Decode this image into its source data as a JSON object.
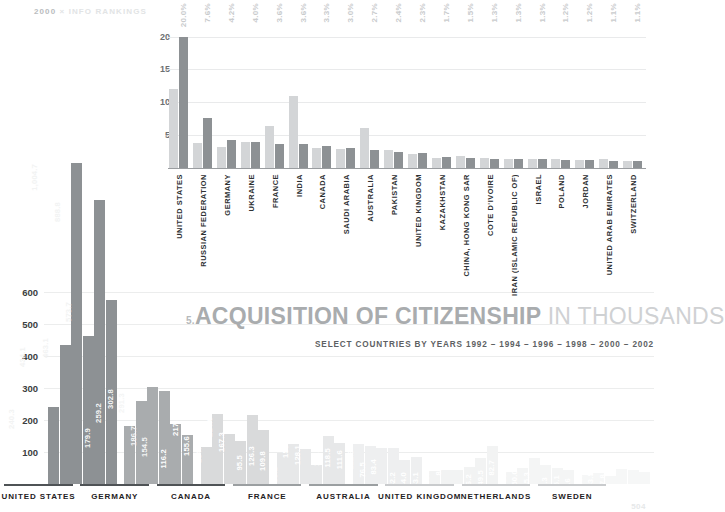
{
  "masthead": {
    "number": "2000",
    "sep": "×",
    "label": "INFO RANKINGS"
  },
  "page_number": "504",
  "title": {
    "index": "5.",
    "main": "ACQUISITION OF CITIZENSHIP",
    "tail": "IN THOUSANDS",
    "subtitle": "SELECT COUNTRIES BY YEARS 1992 – 1994 – 1996 – 1998 – 2000 – 2002"
  },
  "chart_data": [
    {
      "id": "top-chart",
      "type": "bar",
      "title": "",
      "ylabel": "",
      "xlabel": "",
      "ylim": [
        0,
        21
      ],
      "yticks": [
        "5",
        "10",
        "15",
        "20"
      ],
      "ytick_values": [
        5,
        10,
        15,
        20
      ],
      "grid": true,
      "legend": "",
      "categories": [
        "UNITED STATES",
        "RUSSIAN FEDERATION",
        "GERMANY",
        "UKRAINE",
        "FRANCE",
        "INDIA",
        "CANADA",
        "SAUDI ARABIA",
        "AUSTRALIA",
        "PAKISTAN",
        "UNITED KINGDOM",
        "KAZAKHSTAN",
        "CHINA, HONG KONG SAR",
        "COTE D'IVOIRE",
        "IRAN (ISLAMIC REPUBLIC OF)",
        "ISRAEL",
        "POLAND",
        "JORDAN",
        "UNITED ARAB EMIRATES",
        "SWITZERLAND"
      ],
      "percent_labels": [
        "20.0%",
        "7.6%",
        "4.2%",
        "4.0%",
        "3.6%",
        "3.6%",
        "3.3%",
        "3.0%",
        "2.7%",
        "2.4%",
        "2.3%",
        "1.7%",
        "1.5%",
        "1.3%",
        "1.3%",
        "1.3%",
        "1.2%",
        "1.2%",
        "1.1%",
        "1.1%"
      ],
      "series": [
        {
          "name": "light",
          "color": "#d3d5d7",
          "values": [
            12.0,
            3.8,
            3.2,
            4.0,
            6.4,
            11.0,
            3.1,
            2.9,
            6.1,
            2.7,
            2.2,
            1.6,
            1.9,
            1.5,
            1.4,
            1.4,
            1.3,
            1.2,
            1.4,
            1.0
          ]
        },
        {
          "name": "dark",
          "color": "#8d9194",
          "values": [
            20.0,
            7.6,
            4.2,
            4.0,
            3.6,
            3.6,
            3.3,
            3.0,
            2.7,
            2.4,
            2.3,
            1.7,
            1.5,
            1.3,
            1.3,
            1.3,
            1.2,
            1.2,
            1.1,
            1.1
          ]
        }
      ]
    },
    {
      "id": "main-chart",
      "type": "bar",
      "title": "ACQUISITION OF CITIZENSHIP IN THOUSANDS",
      "subtitle": "SELECT COUNTRIES BY YEARS 1992 – 1994 – 1996 – 1998 – 2000 – 2002",
      "ylabel": "",
      "xlabel": "",
      "ylim": [
        0,
        1050
      ],
      "yticks": [
        "100",
        "200",
        "300",
        "400",
        "500",
        "600"
      ],
      "ytick_values": [
        100,
        200,
        300,
        400,
        500,
        600
      ],
      "grid": true,
      "years": [
        "1992",
        "1994",
        "1996",
        "1998",
        "2000",
        "2002"
      ],
      "categories": [
        "UNITED STATES",
        "GERMANY",
        "CANADA",
        "FRANCE",
        "AUSTRALIA",
        "UNITED KINGDOM",
        "NETHERLANDS",
        "SWEDEN"
      ],
      "groups": [
        {
          "name": "UNITED STATES",
          "color": "#8d9194",
          "label_color": "#f2f3f3",
          "opacity": 1.0,
          "values": [
            240.3,
            434.1,
            1004.7,
            463.1,
            888.8,
            573.7
          ],
          "value_labels": [
            "240.3",
            "434.1",
            "1,004.7",
            "463.1",
            "888.8",
            "573.7"
          ]
        },
        {
          "name": "GERMANY",
          "color": "#a9acae",
          "label_color": "#f4f5f5",
          "opacity": 1.0,
          "values": [
            179.9,
            259.2,
            302.8,
            291.3,
            186.7,
            154.5
          ],
          "value_labels": [
            "179.9",
            "259.2",
            "302.8",
            "291.3",
            "186.7",
            "154.5"
          ]
        },
        {
          "name": "CANADA",
          "color": "#d9dadb",
          "label_color": "#ffffff",
          "opacity": 1.0,
          "values": [
            116.2,
            217.3,
            155.6,
            134.6,
            214.6,
            167.3
          ],
          "value_labels": [
            "116.2",
            "217.3",
            "155.6",
            "134.6",
            "214.6",
            "167.3"
          ]
        },
        {
          "name": "FRANCE",
          "color": "#e7e8e9",
          "label_color": "#ffffff",
          "opacity": 1.0,
          "values": [
            95.5,
            126.3,
            109.8,
            58.1,
            150.0,
            128.1
          ],
          "value_labels": [
            "95.5",
            "126.3",
            "109.8",
            "58.1",
            "150.0",
            "128.1"
          ]
        },
        {
          "name": "AUSTRALIA",
          "color": "#eeeff0",
          "label_color": "#ffffff",
          "opacity": 1.0,
          "values": [
            125.4,
            118.5,
            111.6,
            112.3,
            76.5,
            83.4
          ],
          "value_labels": [
            "125.4",
            "118.5",
            "111.6",
            "112.3",
            "76.5",
            "83.4"
          ]
        },
        {
          "name": "UNITED KINGDOM",
          "color": "#f2f3f3",
          "label_color": "#ffffff",
          "opacity": 1.0,
          "values": [
            42.2,
            44.0,
            43.1,
            53.9,
            82.2,
            120.1
          ],
          "value_labels": [
            "42.2",
            "44.0",
            "43.1",
            "53.9",
            "82.2",
            "120.1"
          ]
        },
        {
          "name": "NETHERLANDS",
          "color": "#f4f5f5",
          "label_color": "#ffffff",
          "opacity": 1.0,
          "values": [
            36.2,
            49.5,
            82.7,
            59.2,
            50.0,
            45.3
          ],
          "value_labels": [
            "36.2",
            "49.5",
            "82.7",
            "59.2",
            "50.0",
            "45.3"
          ]
        },
        {
          "name": "SWEDEN",
          "color": "#f6f7f7",
          "label_color": "#ffffff",
          "opacity": 1.0,
          "values": [
            29.3,
            35.1,
            25.6,
            46.5,
            43.5,
            37.8
          ],
          "value_labels": [
            "29.3",
            "35.1",
            "25.6",
            "46.5",
            "43.5",
            "37.8"
          ]
        }
      ]
    }
  ]
}
